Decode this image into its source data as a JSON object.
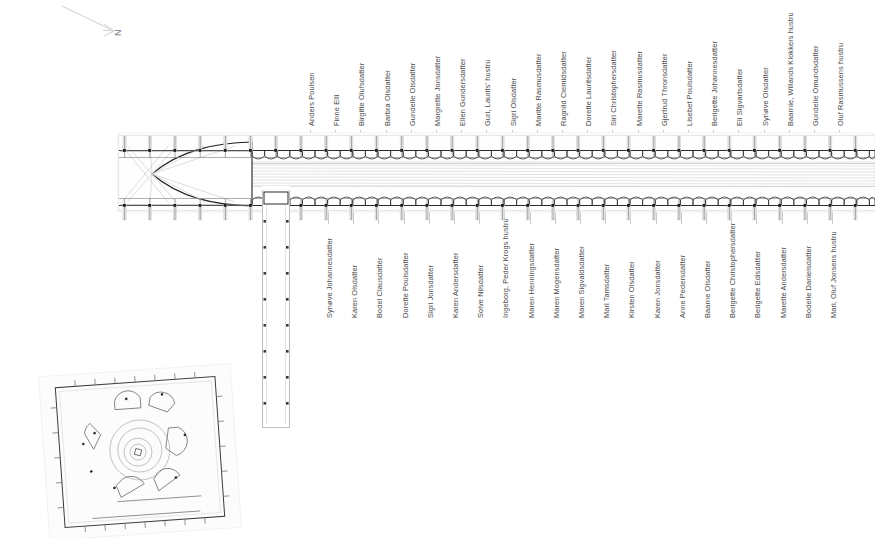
{
  "figure": {
    "type": "architectural-floor-plan",
    "north_arrow_label": "N"
  },
  "labels_top": [
    "Anders Poulsen",
    "Finne Elli",
    "Birgitte Olufsdatter",
    "Barbra Olsdatter",
    "Gundelle Olsdatter",
    "Margrette Jonsdatter",
    "Ellen Gundersdatter",
    "Guri, Laurits' hustru",
    "Sigri Olsdatter",
    "Maritte Rasmusdatter",
    "Ragnild Clemidsdatter",
    "Dorette Lauritsdatter",
    "Siri Christophersdatter",
    "Marette Rasmusdatter",
    "Gjertrud Thronsdatter",
    "Lisebet Poulsdatter",
    "Berigette Johannesdatter",
    "Eli Sigvartsdatter",
    "Synøve Olsdatter",
    "Baarnie, Willands Klokkers hustru",
    "Gundelle Omundsdatter",
    "Oluf Rasmussens hustru"
  ],
  "labels_bottom": [
    "Synøve Johannesdatter",
    "Karen Olsdatter",
    "Bodel Clausdatter",
    "Dorette Poulsdatter",
    "Sigri Jonsdatter",
    "Karen Andersdatter",
    "Solve Nilsdatter",
    "Ingeborg, Peder Krogs hustru",
    "Maren Henningsdatter",
    "Maren Mogensdatter",
    "Maren Sigvaldsdatter",
    "Mari Tamsdatter",
    "Kirsten Olsdatter",
    "Karen Jonsdatter",
    "Anne Pedersdatter",
    "Baarne Olsdatter",
    "Berigette Christophersdatter",
    "Berigette Edisdatter",
    "Marette Andersdatter",
    "Bodelle Danielsdatter",
    "Mari, Oluf Jonsens hustru"
  ],
  "geometry": {
    "nave": {
      "x": 118,
      "y": 135,
      "w": 757,
      "h": 75
    },
    "transept": {
      "x": 262,
      "y": 212,
      "w": 28,
      "h": 216
    },
    "apse": {
      "tip_x": 150,
      "base_x": 252
    },
    "inset_plan": {
      "x": 45,
      "y": 370,
      "w": 190,
      "h": 165,
      "rotation_deg": -4
    }
  },
  "colors": {
    "ink": "#2b2b2b",
    "light_ink": "#b9b9b9",
    "faint": "#e2e2e2",
    "label_text": "#4a4a4a",
    "bench_fill": "#ededed",
    "page_bg": "#ffffff"
  }
}
